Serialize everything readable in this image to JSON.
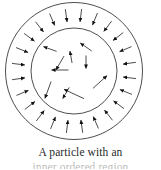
{
  "figure": {
    "name": "two-concentric-circles-arrow-field",
    "stroke_color": "#3a3a3a",
    "arrow_color": "#111111",
    "background_color": "#ffffff",
    "center": {
      "x": 74,
      "y": 71
    },
    "outer_circle": {
      "cx": 74,
      "cy": 71,
      "r": 68.5,
      "label": "outer-circle"
    },
    "inner_circle": {
      "cx": 74,
      "cy": 71,
      "r": 43.0,
      "label": "inner-circle"
    },
    "outer_ring_arrow_count": 24,
    "inner_arrow_count": 10,
    "outer_ring_arrows": [
      {
        "angle": 262,
        "radius": 56,
        "length": 13,
        "direction": "inward"
      },
      {
        "angle": 277,
        "radius": 56,
        "length": 13,
        "direction": "inward"
      },
      {
        "angle": 292,
        "radius": 56,
        "length": 13,
        "direction": "inward"
      },
      {
        "angle": 307,
        "radius": 56,
        "length": 13,
        "direction": "inward"
      },
      {
        "angle": 322,
        "radius": 56,
        "length": 13,
        "direction": "inward"
      },
      {
        "angle": 337,
        "radius": 56,
        "length": 13,
        "direction": "inward"
      },
      {
        "angle": 352,
        "radius": 56,
        "length": 13,
        "direction": "inward"
      },
      {
        "angle": 7,
        "radius": 56,
        "length": 13,
        "direction": "inward"
      },
      {
        "angle": 22,
        "radius": 56,
        "length": 13,
        "direction": "inward"
      },
      {
        "angle": 37,
        "radius": 56,
        "length": 13,
        "direction": "inward"
      },
      {
        "angle": 52,
        "radius": 56,
        "length": 13,
        "direction": "inward"
      },
      {
        "angle": 67,
        "radius": 56,
        "length": 13,
        "direction": "inward"
      },
      {
        "angle": 82,
        "radius": 56,
        "length": 13,
        "direction": "inward"
      },
      {
        "angle": 97,
        "radius": 56,
        "length": 13,
        "direction": "inward"
      },
      {
        "angle": 112,
        "radius": 56,
        "length": 13,
        "direction": "inward"
      },
      {
        "angle": 127,
        "radius": 56,
        "length": 13,
        "direction": "inward"
      },
      {
        "angle": 142,
        "radius": 56,
        "length": 13,
        "direction": "inward"
      },
      {
        "angle": 157,
        "radius": 56,
        "length": 13,
        "direction": "inward"
      },
      {
        "angle": 172,
        "radius": 56,
        "length": 13,
        "direction": "inward"
      },
      {
        "angle": 187,
        "radius": 56,
        "length": 13,
        "direction": "inward"
      },
      {
        "angle": 202,
        "radius": 56,
        "length": 13,
        "direction": "inward"
      },
      {
        "angle": 217,
        "radius": 56,
        "length": 13,
        "direction": "inward"
      },
      {
        "angle": 232,
        "radius": 56,
        "length": 13,
        "direction": "inward"
      },
      {
        "angle": 247,
        "radius": 56,
        "length": 13,
        "direction": "inward"
      }
    ],
    "inner_arrows": [
      {
        "x": 50,
        "y": 49,
        "heading": 200,
        "length": 14
      },
      {
        "x": 86,
        "y": 47,
        "heading": 215,
        "length": 14
      },
      {
        "x": 71,
        "y": 57,
        "heading": 260,
        "length": 12
      },
      {
        "x": 86,
        "y": 62,
        "heading": 90,
        "length": 13
      },
      {
        "x": 60,
        "y": 70,
        "heading": 180,
        "length": 17
      },
      {
        "x": 100,
        "y": 82,
        "heading": 318,
        "length": 19
      },
      {
        "x": 48,
        "y": 90,
        "heading": 110,
        "length": 18
      },
      {
        "x": 66,
        "y": 93,
        "heading": 120,
        "length": 13
      },
      {
        "x": 74,
        "y": 94,
        "heading": 205,
        "length": 22
      },
      {
        "x": 60,
        "y": 63,
        "heading": 120,
        "length": 16
      }
    ]
  },
  "caption": {
    "line1": "A particle with an",
    "line2": "inner ordered region"
  }
}
